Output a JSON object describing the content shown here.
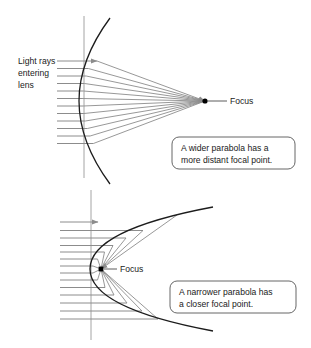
{
  "figure": {
    "background_color": "#ffffff",
    "ray_color": "#8c8c8c",
    "curve_color": "#1c1c1c",
    "text_color": "#1a1a1a"
  },
  "top_diagram": {
    "name": "wider-parabola",
    "incoming_label_line1": "Light rays",
    "incoming_label_line2": "entering",
    "incoming_label_line3": "lens",
    "focus_label": "Focus",
    "callout_line1": "A wider parabola has a",
    "callout_line2": "more distant focal point.",
    "ray_count": 11,
    "focus_x": 205,
    "focus_y": 101
  },
  "bottom_diagram": {
    "name": "narrower-parabola",
    "focus_label": "Focus",
    "callout_line1": "A narrower parabola has",
    "callout_line2": "a closer focal point.",
    "ray_count": 12,
    "focus_x": 101,
    "focus_y": 269
  }
}
